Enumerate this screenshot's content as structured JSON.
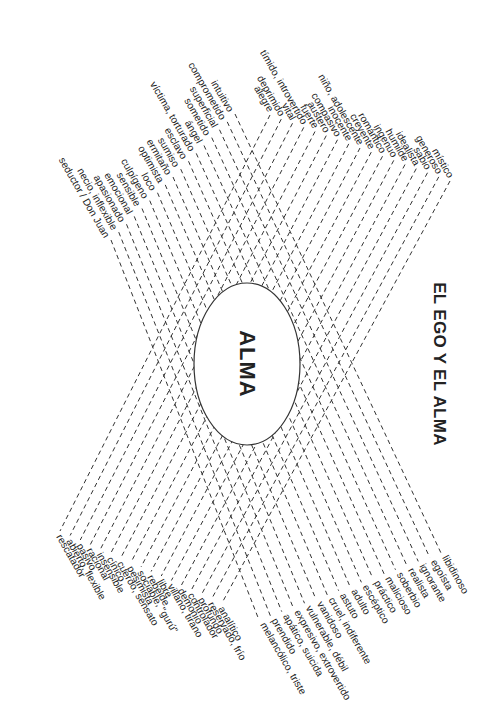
{
  "title": "EL EGO Y EL ALMA",
  "center_label": "ALMA",
  "colors": {
    "ink": "#222222",
    "line": "#333333",
    "background": "#ffffff"
  },
  "groups": {
    "top_left": [
      "intuitivo",
      "comprometido",
      "superficial",
      "sometido",
      "ángel",
      "víctima, torturado",
      "esclavo",
      "sumiso",
      "ermitaño",
      "optimista",
      "loco",
      "culpígeno",
      "sensible",
      "emocional",
      "apasionado",
      "necio, inflexible",
      "seductor / Don Juan"
    ],
    "top_right": [
      "místico",
      "generoso",
      "sabio",
      "idealista",
      "humilde",
      "ingenuo",
      "romántico",
      "creyente",
      "niño, adolescente",
      "inocente",
      "compasivo",
      "austero",
      "fuerte",
      "tímido, introvertido",
      "vital",
      "deprimido",
      "alegre"
    ],
    "bottom_right": [
      "libidinoso",
      "egoísta",
      "ignorante",
      "realista",
      "soberbio",
      "malicioso",
      "práctico",
      "escéptico",
      "adulto",
      "astuto",
      "cruel, indiferente",
      "vanidoso",
      "vulnerable, débil",
      "expresivo, extrovertido",
      "apático, suicida",
      "prendido",
      "melancólico, triste"
    ],
    "bottom_left": [
      "analítico",
      "reservado, frío",
      "profundo",
      "controlador",
      "demonio",
      "villano, tirano",
      "libre",
      "rebelde",
      "sociable, \"gurú\"",
      "pesimista",
      "cuerdo, sensato",
      "cínico",
      "insensible",
      "racional",
      "pasivo",
      "abierto, flexible",
      "rescatador"
    ]
  }
}
